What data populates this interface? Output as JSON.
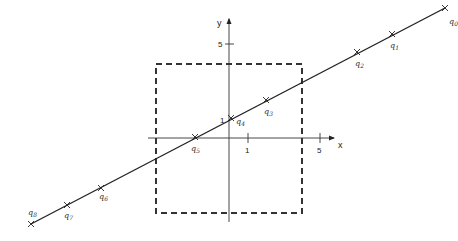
{
  "diagram": {
    "axes": {
      "x_label": "x",
      "y_label": "y",
      "x_ticks": [
        {
          "label": "1",
          "px": 248
        },
        {
          "label": "5",
          "px": 320
        }
      ],
      "y_ticks": [
        {
          "label": "1",
          "py": 120
        },
        {
          "label": "5",
          "py": 44
        }
      ],
      "origin_px": [
        229,
        138
      ]
    },
    "dashed_box": {
      "x": 156,
      "y": 64,
      "width": 146,
      "height": 149
    },
    "line": {
      "from": [
        31,
        224
      ],
      "to": [
        445,
        8
      ]
    },
    "points": [
      {
        "name": "q",
        "sub": "0",
        "px": [
          445,
          8
        ],
        "label_px": [
          449,
          24
        ]
      },
      {
        "name": "q",
        "sub": "1",
        "px": [
          392,
          34
        ],
        "label_px": [
          390,
          48
        ]
      },
      {
        "name": "q",
        "sub": "2",
        "px": [
          357,
          52
        ],
        "label_px": [
          355,
          66
        ]
      },
      {
        "name": "q",
        "sub": "3",
        "px": [
          266,
          100
        ],
        "label_px": [
          264,
          114
        ]
      },
      {
        "name": "q",
        "sub": "4",
        "px": [
          231,
          118
        ],
        "label_px": [
          236,
          124
        ]
      },
      {
        "name": "q",
        "sub": "5",
        "px": [
          195,
          137
        ],
        "label_px": [
          191,
          151
        ]
      },
      {
        "name": "q",
        "sub": "6",
        "px": [
          101,
          188
        ],
        "label_px": [
          99,
          199
        ]
      },
      {
        "name": "q",
        "sub": "7",
        "px": [
          67,
          205
        ],
        "label_px": [
          64,
          218
        ]
      },
      {
        "name": "q",
        "sub": "8",
        "px": [
          31,
          224
        ],
        "label_px": [
          28,
          215
        ]
      }
    ],
    "colors": {
      "line": "#222222",
      "box": "#333333",
      "axes": "#333333"
    }
  }
}
